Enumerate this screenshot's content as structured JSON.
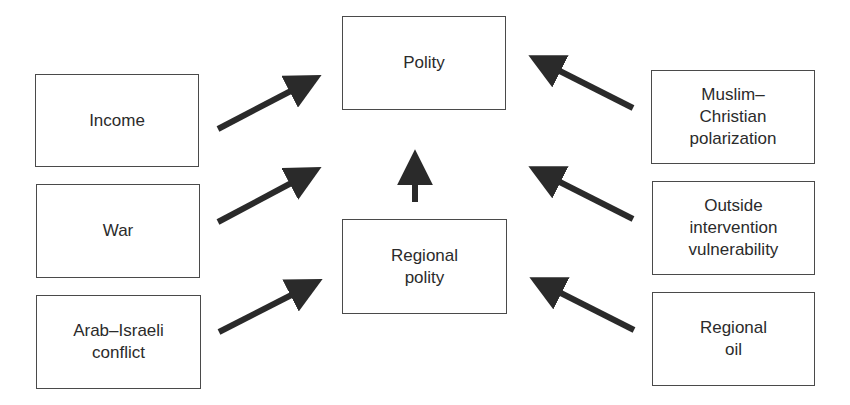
{
  "diagram": {
    "type": "causal-flow",
    "colors": {
      "border": "#4a4a4a",
      "text": "#2b2b2b",
      "arrow": "#2a2a2a",
      "background": "#ffffff"
    },
    "nodes": {
      "income": {
        "label": "Income"
      },
      "war": {
        "label": "War"
      },
      "arab_israeli": {
        "label": "Arab–Israeli\nconflict"
      },
      "polity": {
        "label": "Polity"
      },
      "regional_polity": {
        "label": "Regional\npolity"
      },
      "muslim_christian": {
        "label": "Muslim–\nChristian\npolarization"
      },
      "outside_intervention": {
        "label": "Outside\nintervention\nvulnerability"
      },
      "regional_oil": {
        "label": "Regional\noil"
      }
    },
    "edges": [
      {
        "from": "Income",
        "to": "Polity"
      },
      {
        "from": "War",
        "to": "Polity"
      },
      {
        "from": "Arab–Israeli conflict",
        "to": "Regional polity"
      },
      {
        "from": "Regional polity",
        "to": "Polity"
      },
      {
        "from": "Muslim–Christian polarization",
        "to": "Polity"
      },
      {
        "from": "Outside intervention vulnerability",
        "to": "Polity"
      },
      {
        "from": "Regional oil",
        "to": "Regional polity"
      }
    ]
  }
}
